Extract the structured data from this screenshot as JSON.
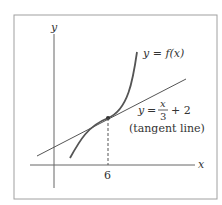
{
  "diagram": {
    "axes": {
      "x_label": "x",
      "y_label": "y"
    },
    "tick": {
      "x_value": "6"
    },
    "curve": {
      "label_lhs": "y",
      "label_eq": "=",
      "label_rhs": "f(x)"
    },
    "tangent": {
      "lhs": "y",
      "eq": "=",
      "num": "x",
      "den": "3",
      "plus": "+ 2",
      "caption": "(tangent line)"
    },
    "colors": {
      "frame": "#9a9a9a",
      "line": "#444444",
      "curve": "#555555"
    }
  }
}
